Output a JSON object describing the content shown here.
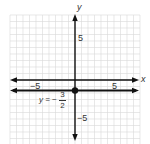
{
  "chart_data": {
    "type": "line",
    "title": "",
    "xlabel": "x",
    "ylabel": "y",
    "xlim": [
      -10,
      10
    ],
    "ylim": [
      -10,
      10
    ],
    "grid": true,
    "x_ticks_labeled": [
      -5,
      5
    ],
    "y_ticks_labeled": [
      5,
      -5
    ],
    "tick_labels": {
      "x_neg": "−5",
      "x_pos": "5",
      "y_pos": "5",
      "y_neg": "−5"
    },
    "series": [
      {
        "name": "y = -3/2",
        "kind": "horizontal_line",
        "y": -1.5,
        "color": "#111111"
      }
    ],
    "points": [
      {
        "x": 0,
        "y": -1.5,
        "label": ""
      }
    ],
    "annotations": [
      {
        "text_prefix": "y = −",
        "numerator": "3",
        "denominator": "2",
        "near": {
          "x": -3,
          "y": -2.5
        }
      }
    ]
  },
  "labels": {
    "x_axis": "x",
    "y_axis": "y",
    "x_neg": "−5",
    "x_pos": "5",
    "y_pos": "5",
    "y_neg": "−5",
    "eq_prefix": "y = −",
    "eq_num": "3",
    "eq_den": "2"
  },
  "colors": {
    "grid": "#d8d8d8",
    "axis": "#111111",
    "line": "#111111",
    "text": "#333333"
  }
}
